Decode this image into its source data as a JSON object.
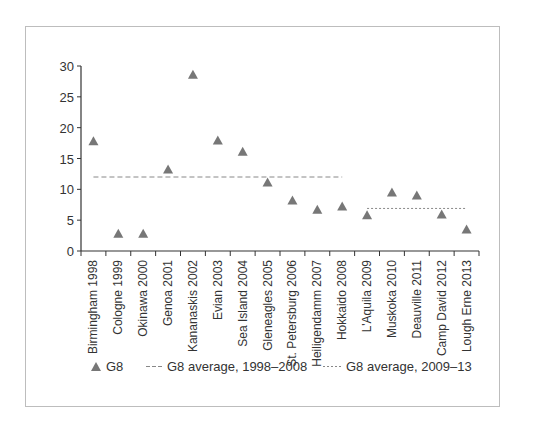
{
  "chart_data": {
    "type": "scatter",
    "title": "",
    "xlabel": "",
    "ylabel": "",
    "ylim": [
      0,
      30
    ],
    "yticks": [
      0,
      5,
      10,
      15,
      20,
      25,
      30
    ],
    "grid": false,
    "categories": [
      "Birmingham 1998",
      "Cologne 1999",
      "Okinawa 2000",
      "Genoa 2001",
      "Kananaskis 2002",
      "Evian 2003",
      "Sea Island 2004",
      "Gleneagles 2005",
      "St. Petersburg 2006",
      "Heiligendamm 2007",
      "Hokkaido 2008",
      "L'Aquila 2009",
      "Muskoka 2010",
      "Deauville 2011",
      "Camp David 2012",
      "Lough Erne 2013"
    ],
    "series": [
      {
        "name": "G8",
        "marker": "triangle",
        "color": "#777777",
        "values": [
          17.8,
          2.8,
          2.8,
          13.2,
          28.6,
          17.9,
          16.1,
          11.1,
          8.2,
          6.7,
          7.2,
          5.8,
          9.5,
          9.0,
          5.9,
          3.5
        ]
      }
    ],
    "reference_lines": [
      {
        "name": "G8 average, 1998–2008",
        "style": "dashed",
        "color": "#888888",
        "value": 12.0,
        "from": "Birmingham 1998",
        "to": "Hokkaido 2008"
      },
      {
        "name": "G8 average, 2009–13",
        "style": "dotted",
        "color": "#888888",
        "value": 6.9,
        "from": "L'Aquila 2009",
        "to": "Lough Erne 2013"
      }
    ],
    "legend": {
      "position": "bottom",
      "entries": [
        "G8",
        "G8 average, 1998–2008",
        "G8 average, 2009–13"
      ]
    }
  }
}
